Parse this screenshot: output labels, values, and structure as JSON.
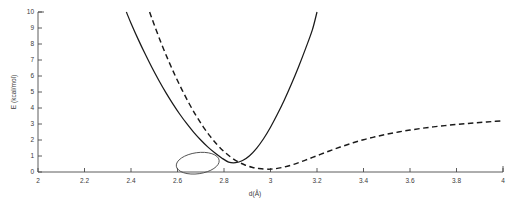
{
  "chart_data": {
    "type": "line",
    "title": "",
    "xlabel": "d(Å)",
    "ylabel": "E (kcal/mol)",
    "xlim": [
      2,
      4
    ],
    "ylim": [
      0,
      10
    ],
    "xticks": [
      2,
      2.2,
      2.4,
      2.6,
      2.8,
      3,
      3.2,
      3.4,
      3.6,
      3.8,
      4
    ],
    "xtick_labels": [
      "2",
      "2.2",
      "2.4",
      "2.6",
      "2.8",
      "3",
      "3.2",
      "3.4",
      "3.6",
      "3.8",
      "4"
    ],
    "yticks": [
      0,
      1,
      2,
      3,
      4,
      5,
      6,
      7,
      8,
      9,
      10
    ],
    "ytick_labels": [
      "0",
      "1",
      "2",
      "3",
      "4",
      "5",
      "6",
      "7",
      "8",
      "9",
      "10"
    ],
    "grid": false,
    "legend": "none",
    "series": [
      {
        "name": "harmonic-potential",
        "style": "solid",
        "color": "#1a1a1a",
        "x": [
          2.38,
          2.4,
          2.43,
          2.46,
          2.49,
          2.52,
          2.55,
          2.58,
          2.61,
          2.64,
          2.67,
          2.7,
          2.73,
          2.76,
          2.79,
          2.82,
          2.85,
          2.88,
          2.91,
          2.94,
          2.97,
          3.0,
          3.03,
          3.06,
          3.09,
          3.12,
          3.15,
          3.18,
          3.2
        ],
        "y": [
          10.0,
          9.3,
          8.32,
          7.4,
          6.53,
          5.72,
          4.96,
          4.26,
          3.61,
          3.02,
          2.48,
          2.0,
          1.57,
          1.2,
          0.88,
          0.62,
          0.58,
          0.72,
          1.02,
          1.48,
          2.08,
          2.8,
          3.62,
          4.52,
          5.5,
          6.55,
          7.68,
          8.88,
          10.0
        ],
        "note": "steep symmetric well, minimum E~0.55 near d=2.84"
      },
      {
        "name": "anharmonic-potential",
        "style": "dashed",
        "color": "#1a1a1a",
        "x": [
          2.48,
          2.5,
          2.53,
          2.56,
          2.59,
          2.62,
          2.65,
          2.68,
          2.71,
          2.74,
          2.77,
          2.8,
          2.83,
          2.86,
          2.89,
          2.92,
          2.95,
          3.0,
          3.05,
          3.1,
          3.15,
          3.2,
          3.25,
          3.3,
          3.35,
          3.4,
          3.45,
          3.5,
          3.55,
          3.6,
          3.65,
          3.7,
          3.75,
          3.8,
          3.85,
          3.9,
          3.95,
          4.0
        ],
        "y": [
          10.0,
          9.2,
          8.05,
          7.0,
          6.02,
          5.12,
          4.28,
          3.52,
          2.84,
          2.24,
          1.72,
          1.28,
          0.92,
          0.64,
          0.44,
          0.3,
          0.22,
          0.18,
          0.28,
          0.48,
          0.74,
          1.02,
          1.3,
          1.56,
          1.8,
          2.02,
          2.2,
          2.36,
          2.5,
          2.62,
          2.73,
          2.82,
          2.9,
          2.97,
          3.03,
          3.09,
          3.15,
          3.2
        ],
        "note": "shallow asymmetric well, asymptote ~3.2 kcal/mol at d=4"
      }
    ],
    "annotations": [
      {
        "name": "crossing-highlight-ellipse",
        "shape": "ellipse",
        "center_data": [
          2.687,
          0.55
        ],
        "rx_data": 0.093,
        "ry_data": 0.66,
        "rotation_deg": -8,
        "color": "#4a4a4a"
      }
    ]
  },
  "axes": {
    "xlabel": "d(Å)",
    "ylabel": "E (kcal/mol)"
  }
}
